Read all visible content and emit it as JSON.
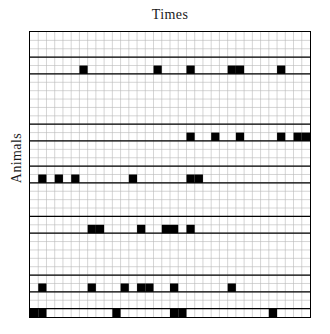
{
  "figure": {
    "type": "raster-matrix-plot",
    "x_axis_title": "Times",
    "y_axis_title": "Animals",
    "background_color": "#ffffff",
    "filled_cell_color": "#000000",
    "minor_grid_color": "#b9b9b9",
    "major_grid_color": "#000000",
    "border_color": "#000000"
  },
  "chart_data": {
    "type": "heatmap",
    "title": "",
    "xlabel": "Times",
    "ylabel": "Animals",
    "n_cols": 34,
    "n_rows": 34,
    "xlim": [
      0,
      34
    ],
    "ylim": [
      0,
      34
    ],
    "grid": true,
    "legend": "none",
    "values_are_binary": true,
    "value_labels": {
      "0": "no event",
      "1": "event"
    },
    "major_row_separators": [
      3,
      5,
      11,
      13,
      16,
      18,
      22,
      24,
      29,
      31,
      33
    ],
    "active_rows": [
      {
        "row": 4,
        "cols": [
          6,
          15,
          19,
          24,
          25,
          30
        ]
      },
      {
        "row": 12,
        "cols": [
          19,
          22,
          25,
          30,
          32,
          33
        ]
      },
      {
        "row": 17,
        "cols": [
          1,
          3,
          5,
          12,
          19,
          20
        ]
      },
      {
        "row": 23,
        "cols": [
          7,
          8,
          13,
          16,
          17,
          19
        ]
      },
      {
        "row": 30,
        "cols": [
          1,
          7,
          11,
          13,
          14,
          17,
          24
        ]
      },
      {
        "row": 33,
        "cols": [
          0,
          1,
          10,
          17,
          18,
          29
        ]
      }
    ],
    "series": [
      {
        "name": "Animal A",
        "row": 4,
        "event_times": [
          6,
          15,
          19,
          24,
          25,
          30
        ]
      },
      {
        "name": "Animal B",
        "row": 12,
        "event_times": [
          19,
          22,
          25,
          30,
          32,
          33
        ]
      },
      {
        "name": "Animal C",
        "row": 17,
        "event_times": [
          1,
          3,
          5,
          12,
          19,
          20
        ]
      },
      {
        "name": "Animal D",
        "row": 23,
        "event_times": [
          7,
          8,
          13,
          16,
          17,
          19
        ]
      },
      {
        "name": "Animal E",
        "row": 30,
        "event_times": [
          1,
          7,
          11,
          13,
          14,
          17,
          24
        ]
      },
      {
        "name": "Animal F",
        "row": 33,
        "event_times": [
          0,
          1,
          10,
          17,
          18,
          29
        ]
      }
    ]
  }
}
